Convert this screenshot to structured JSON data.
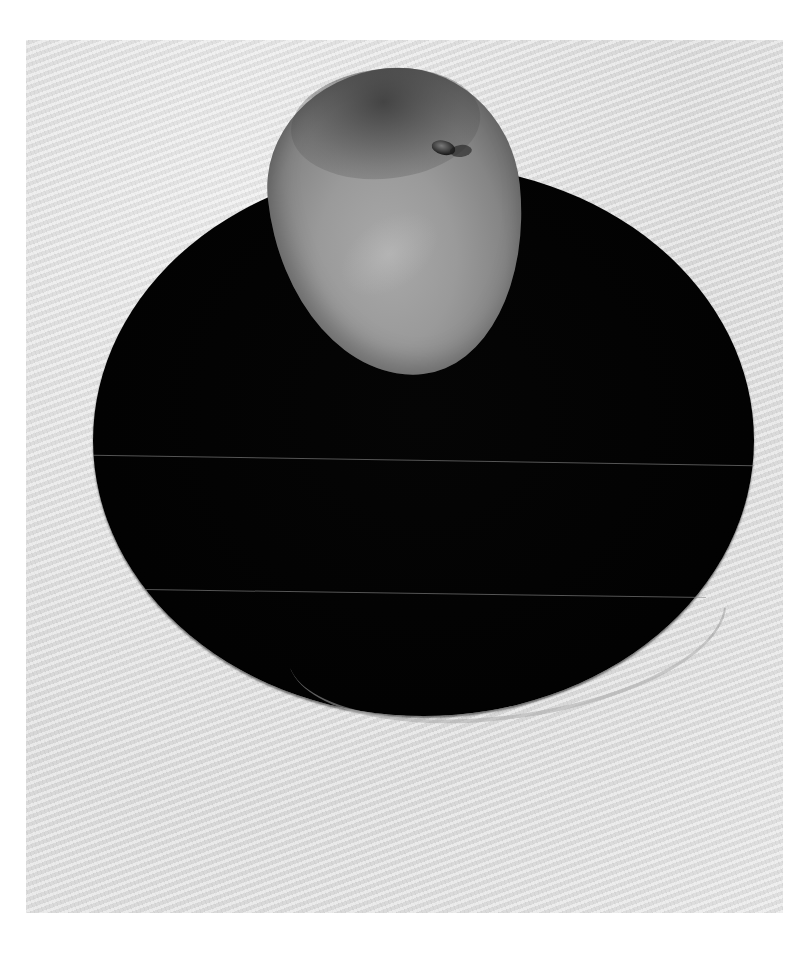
{
  "image": {
    "subject": "Still life of a single peach resting on a dark round plate",
    "style": "grayscale reproduction of a painting/photograph",
    "elements": [
      {
        "name": "background",
        "description": "light gray textured cloth surface",
        "color": "#e4e4e4"
      },
      {
        "name": "plate",
        "description": "large black oval plate with a faint lighter rim at bottom",
        "color": "#030303"
      },
      {
        "name": "peach",
        "description": "mid-gray peach with stem indentation near top right",
        "color": "#9a9a9a"
      }
    ],
    "colors": {
      "background": "#e4e4e4",
      "plate": "#030303",
      "peach": "#9a9a9a",
      "page": "#ffffff"
    }
  }
}
